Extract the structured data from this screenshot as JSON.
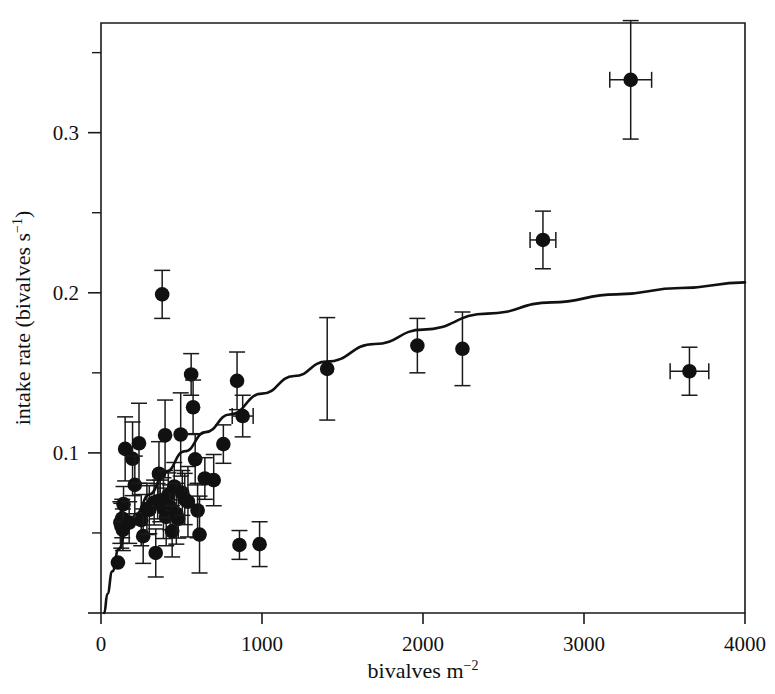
{
  "chart_data": {
    "type": "scatter",
    "title": "",
    "xlabel": "bivalves m−2",
    "ylabel": "intake rate (bivalves s−1)",
    "xlim": [
      0,
      4000
    ],
    "ylim": [
      0,
      0.3685
    ],
    "grid": false,
    "legend": null,
    "xticks": [
      0,
      1000,
      2000,
      3000,
      4000
    ],
    "xtick_labels": [
      "0",
      "1000",
      "2000",
      "3000",
      "4000"
    ],
    "yticks": [
      0.1,
      0.2,
      0.3
    ],
    "ytick_labels": [
      "0.1",
      "0.2",
      "0.3"
    ],
    "yticks_minor": [
      0.05,
      0.15,
      0.25,
      0.35
    ],
    "marker": "filled-circle",
    "marker_color": "#111111",
    "errorbar_color": "#1a1a1a",
    "line_color": "#111111",
    "points": [
      {
        "x": 105,
        "y": 0.0315,
        "yerr": 0.0,
        "xerr": 0
      },
      {
        "x": 120,
        "y": 0.0565,
        "yerr": 0.013,
        "xerr": 0
      },
      {
        "x": 126,
        "y": 0.0545,
        "yerr": 0.014,
        "xerr": 0
      },
      {
        "x": 132,
        "y": 0.059,
        "yerr": 0.012,
        "xerr": 0
      },
      {
        "x": 136,
        "y": 0.052,
        "yerr": 0.013,
        "xerr": 0
      },
      {
        "x": 140,
        "y": 0.068,
        "yerr": 0.011,
        "xerr": 0
      },
      {
        "x": 150,
        "y": 0.1025,
        "yerr": 0.02,
        "xerr": 0
      },
      {
        "x": 175,
        "y": 0.0565,
        "yerr": 0.013,
        "xerr": 0
      },
      {
        "x": 196,
        "y": 0.0963,
        "yerr": 0.023,
        "xerr": 0
      },
      {
        "x": 210,
        "y": 0.08,
        "yerr": 0.018,
        "xerr": 0
      },
      {
        "x": 236,
        "y": 0.106,
        "yerr": 0.025,
        "xerr": 0
      },
      {
        "x": 250,
        "y": 0.058,
        "yerr": 0.016,
        "xerr": 0
      },
      {
        "x": 262,
        "y": 0.048,
        "yerr": 0.017,
        "xerr": 0
      },
      {
        "x": 285,
        "y": 0.065,
        "yerr": 0.016,
        "xerr": 0
      },
      {
        "x": 300,
        "y": 0.0645,
        "yerr": 0.015,
        "xerr": 0
      },
      {
        "x": 330,
        "y": 0.069,
        "yerr": 0.014,
        "xerr": 0
      },
      {
        "x": 340,
        "y": 0.0375,
        "yerr": 0.015,
        "xerr": 0
      },
      {
        "x": 352,
        "y": 0.0698,
        "yerr": 0.011,
        "xerr": 0
      },
      {
        "x": 360,
        "y": 0.087,
        "yerr": 0.02,
        "xerr": 0
      },
      {
        "x": 368,
        "y": 0.07,
        "yerr": 0.013,
        "xerr": 0
      },
      {
        "x": 380,
        "y": 0.199,
        "yerr": 0.015,
        "xerr": 0
      },
      {
        "x": 388,
        "y": 0.0655,
        "yerr": 0.019,
        "xerr": 0
      },
      {
        "x": 398,
        "y": 0.111,
        "yerr": 0.022,
        "xerr": 0
      },
      {
        "x": 405,
        "y": 0.06,
        "yerr": 0.018,
        "xerr": 0
      },
      {
        "x": 418,
        "y": 0.0735,
        "yerr": 0.014,
        "xerr": 0
      },
      {
        "x": 430,
        "y": 0.066,
        "yerr": 0.014,
        "xerr": 0
      },
      {
        "x": 442,
        "y": 0.051,
        "yerr": 0.016,
        "xerr": 0
      },
      {
        "x": 455,
        "y": 0.079,
        "yerr": 0.015,
        "xerr": 0
      },
      {
        "x": 468,
        "y": 0.062,
        "yerr": 0.019,
        "xerr": 0
      },
      {
        "x": 480,
        "y": 0.0588,
        "yerr": 0.012,
        "xerr": 0
      },
      {
        "x": 495,
        "y": 0.1115,
        "yerr": 0.026,
        "xerr": 0
      },
      {
        "x": 505,
        "y": 0.075,
        "yerr": 0.014,
        "xerr": 0
      },
      {
        "x": 520,
        "y": 0.0712,
        "yerr": 0.016,
        "xerr": 0
      },
      {
        "x": 540,
        "y": 0.0695,
        "yerr": 0.022,
        "xerr": 0
      },
      {
        "x": 560,
        "y": 0.149,
        "yerr": 0.013,
        "xerr": 0
      },
      {
        "x": 572,
        "y": 0.1285,
        "yerr": 0.017,
        "xerr": 0
      },
      {
        "x": 585,
        "y": 0.096,
        "yerr": 0.016,
        "xerr": 0
      },
      {
        "x": 600,
        "y": 0.064,
        "yerr": 0.017,
        "xerr": 0
      },
      {
        "x": 612,
        "y": 0.049,
        "yerr": 0.024,
        "xerr": 0
      },
      {
        "x": 645,
        "y": 0.084,
        "yerr": 0.013,
        "xerr": 0
      },
      {
        "x": 700,
        "y": 0.083,
        "yerr": 0.016,
        "xerr": 0
      },
      {
        "x": 760,
        "y": 0.1055,
        "yerr": 0.012,
        "xerr": 0
      },
      {
        "x": 845,
        "y": 0.145,
        "yerr": 0.018,
        "xerr": 0
      },
      {
        "x": 860,
        "y": 0.0425,
        "yerr": 0.009,
        "xerr": 0
      },
      {
        "x": 880,
        "y": 0.123,
        "yerr": 0.013,
        "xerr": 65
      },
      {
        "x": 985,
        "y": 0.043,
        "yerr": 0.014,
        "xerr": 0
      },
      {
        "x": 1405,
        "y": 0.1525,
        "yerr": 0.032,
        "xerr": 0
      },
      {
        "x": 1965,
        "y": 0.167,
        "yerr": 0.017,
        "xerr": 0
      },
      {
        "x": 2245,
        "y": 0.165,
        "yerr": 0.023,
        "xerr": 0
      },
      {
        "x": 2745,
        "y": 0.233,
        "yerr": 0.018,
        "xerr": 80
      },
      {
        "x": 3290,
        "y": 0.333,
        "yerr": 0.037,
        "xerr": 130
      },
      {
        "x": 3655,
        "y": 0.151,
        "yerr": 0.015,
        "xerr": 120
      }
    ],
    "fit_curve": {
      "description": "fitted functional-response curve",
      "x": [
        20,
        40,
        70,
        110,
        160,
        220,
        300,
        400,
        520,
        650,
        800,
        1000,
        1200,
        1400,
        1700,
        2000,
        2400,
        2800,
        3200,
        3600,
        4000
      ],
      "y": [
        0.0,
        0.012,
        0.026,
        0.04,
        0.052,
        0.062,
        0.074,
        0.088,
        0.101,
        0.113,
        0.124,
        0.137,
        0.148,
        0.157,
        0.168,
        0.177,
        0.187,
        0.194,
        0.199,
        0.203,
        0.2065
      ]
    }
  }
}
